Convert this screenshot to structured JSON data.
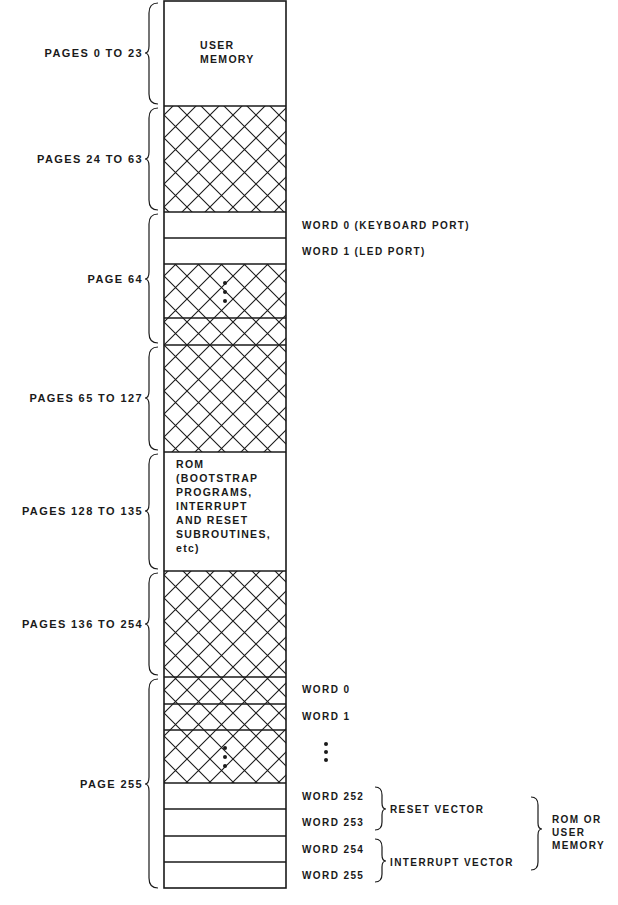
{
  "diagram": {
    "regions": [
      {
        "label": "PAGES 0 TO 23",
        "content": "USER\nMEMORY",
        "hatched": false
      },
      {
        "label": "PAGES 24 TO 63",
        "content": "",
        "hatched": true
      },
      {
        "label": "PAGE 64",
        "words": [
          {
            "label": "WORD 0 (KEYBOARD PORT)",
            "hatched": false
          },
          {
            "label": "WORD 1 (LED PORT)",
            "hatched": false
          },
          {
            "label": "",
            "hatched": true,
            "ellipsis": true
          },
          {
            "label": "",
            "hatched": true
          }
        ]
      },
      {
        "label": "PAGES 65 TO 127",
        "content": "",
        "hatched": true
      },
      {
        "label": "PAGES 128 TO 135",
        "content": "ROM\n(BOOTSTRAP\nPROGRAMS,\nINTERRUPT\nAND RESET\nSUBROUTINES,\netc)",
        "hatched": false
      },
      {
        "label": "PAGES 136 TO 254",
        "content": "",
        "hatched": true
      },
      {
        "label": "PAGE 255",
        "words": [
          {
            "label": "WORD 0",
            "hatched": true
          },
          {
            "label": "WORD 1",
            "hatched": true
          },
          {
            "label": "",
            "hatched": true,
            "ellipsis": true
          },
          {
            "label": "WORD 252",
            "hatched": false
          },
          {
            "label": "WORD 253",
            "hatched": false
          },
          {
            "label": "WORD 254",
            "hatched": false
          },
          {
            "label": "WORD 255",
            "hatched": false
          }
        ]
      }
    ],
    "groups": {
      "reset_vector": "RESET VECTOR",
      "interrupt_vector": "INTERRUPT VECTOR",
      "rom_or_user": "ROM OR\nUSER\nMEMORY"
    },
    "colors": {
      "line": "#1a1a1a",
      "background": "#ffffff"
    }
  }
}
